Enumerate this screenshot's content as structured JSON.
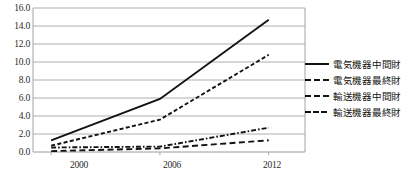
{
  "chart_data": {
    "type": "line",
    "title": "",
    "xlabel": "",
    "ylabel": "",
    "x": [
      2000,
      2006,
      2012
    ],
    "categories": [
      "2000",
      "2006",
      "2012"
    ],
    "xtick_labels": [
      "2000",
      "2006",
      "2012"
    ],
    "ytick_labels": [
      "0.0",
      "2.0",
      "4.0",
      "6.0",
      "8.0",
      "10.0",
      "12.0",
      "14.0",
      "16.0"
    ],
    "ytick_values": [
      0.0,
      2.0,
      4.0,
      6.0,
      8.0,
      10.0,
      12.0,
      14.0,
      16.0
    ],
    "ylim": [
      0.0,
      16.0
    ],
    "xlim": [
      1999,
      2014
    ],
    "grid": "horizontal",
    "legend_position": "right",
    "line_color": "#121212",
    "grid_color": "#9a9a9a",
    "series": [
      {
        "name": "電気機器中間財",
        "style": "solid",
        "values": [
          1.3,
          5.9,
          14.7
        ]
      },
      {
        "name": "電気機器最終財",
        "style": "short-dash",
        "values": [
          0.7,
          3.6,
          10.8
        ]
      },
      {
        "name": "輸送機器中間財",
        "style": "dash-dot",
        "values": [
          0.5,
          0.6,
          2.7
        ]
      },
      {
        "name": "輸送機器最終財",
        "style": "long-dash",
        "values": [
          0.1,
          0.4,
          1.3
        ]
      }
    ]
  },
  "legend": {
    "items": [
      {
        "label": "電気機器中間財"
      },
      {
        "label": "電気機器最終財"
      },
      {
        "label": "輸送機器中間財"
      },
      {
        "label": "輸送機器最終財"
      }
    ]
  },
  "axes": {
    "y_labels": [
      "16.0",
      "14.0",
      "12.0",
      "10.0",
      "8.0",
      "6.0",
      "4.0",
      "2.0",
      "0.0"
    ],
    "x_labels": [
      "2000",
      "2006",
      "2012"
    ]
  },
  "footnote": {
    "text": ""
  }
}
